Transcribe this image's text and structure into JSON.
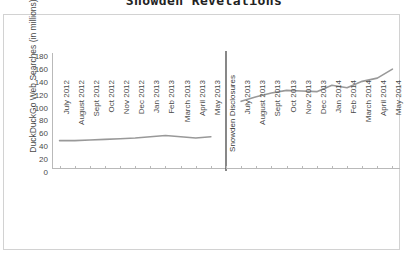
{
  "chart_data": {
    "type": "line",
    "title": "Snowden Revelations",
    "xlabel": "",
    "ylabel": "DuckDuckGo Web Searches (in millions)",
    "ylim": [
      0,
      180
    ],
    "yticks": [
      0,
      20,
      40,
      60,
      80,
      100,
      120,
      140,
      160,
      180
    ],
    "grid": false,
    "legend": "none",
    "categories": [
      "July 2012",
      "August 2012",
      "Sept 2012",
      "Oct 2012",
      "Nov 2012",
      "Dec 2012",
      "Jan 2013",
      "Feb 2013",
      "March 2013",
      "April 2013",
      "May 2013",
      "Snowden Disclosures",
      "July 2013",
      "August 2013",
      "Sept 2013",
      "Oct 2013",
      "Nov 2013",
      "Dec 2013",
      "Jan 2014",
      "Feb 2014",
      "March 2014",
      "April 2014",
      "May 2014"
    ],
    "values": [
      44,
      44,
      45,
      46,
      47,
      48,
      50,
      52,
      50,
      48,
      50,
      null,
      105,
      112,
      118,
      122,
      121,
      120,
      130,
      126,
      136,
      141,
      155
    ],
    "annotations": [
      {
        "name": "snowden-disclosures-divider",
        "label": "Snowden Disclosures",
        "category_index": 11,
        "type": "vertical-line"
      }
    ],
    "series_color": "#999999",
    "divider_color": "#555555",
    "axis_color": "#b9b9b9"
  }
}
